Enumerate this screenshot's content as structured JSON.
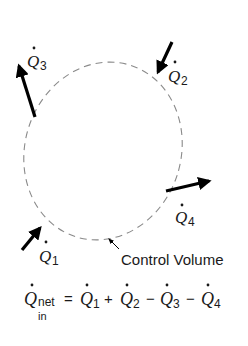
{
  "diagram": {
    "boundary_label": "Control Volume",
    "heat_flows": [
      {
        "id": "Q1",
        "symbol": "Q",
        "subscript": "1",
        "direction": "in"
      },
      {
        "id": "Q2",
        "symbol": "Q",
        "subscript": "2",
        "direction": "in"
      },
      {
        "id": "Q3",
        "symbol": "Q",
        "subscript": "3",
        "direction": "out"
      },
      {
        "id": "Q4",
        "symbol": "Q",
        "subscript": "4",
        "direction": "out"
      }
    ],
    "equation": {
      "lhs_symbol": "Q",
      "lhs_sub_top": "net",
      "lhs_sub_bottom": "in",
      "equals": "=",
      "terms": [
        {
          "sign": "",
          "symbol": "Q",
          "subscript": "1"
        },
        {
          "sign": "+",
          "symbol": "Q",
          "subscript": "2"
        },
        {
          "sign": "−",
          "symbol": "Q",
          "subscript": "3"
        },
        {
          "sign": "−",
          "symbol": "Q",
          "subscript": "4"
        }
      ]
    },
    "colors": {
      "arrow": "#000000",
      "boundary": "#8a8a8a",
      "text": "#1a1a1a"
    }
  }
}
